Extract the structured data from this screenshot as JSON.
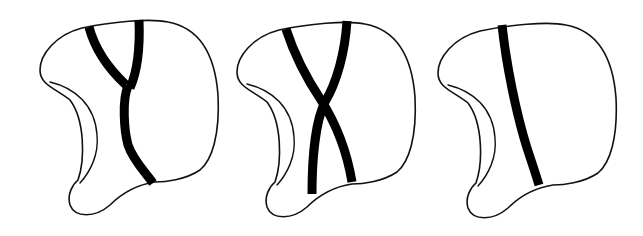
{
  "figure": {
    "panel_count": 3,
    "colors": {
      "background": "#ffffff",
      "outline": "#111111",
      "band": "#000000"
    },
    "panels": [
      {
        "id": "panel-1",
        "description": "Outline shape with a Y-shaped dark band (two upper branches merging into one lower trunk)",
        "band_pattern": "Y-shaped"
      },
      {
        "id": "panel-2",
        "description": "Outline shape with two dark bands crossing in an X pattern",
        "band_pattern": "X-shaped"
      },
      {
        "id": "panel-3",
        "description": "Outline shape with a single dark band running from top to bottom",
        "band_pattern": "single"
      }
    ]
  }
}
